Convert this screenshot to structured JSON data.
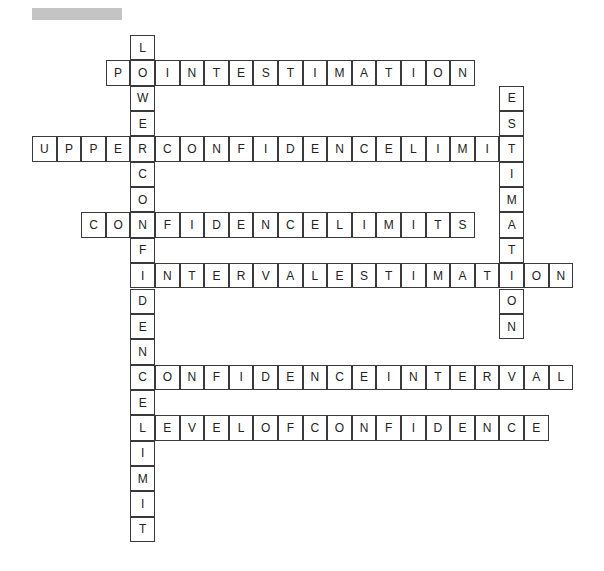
{
  "header": {
    "title_redacted": true
  },
  "grid": {
    "origin_x": 32,
    "origin_y": 35,
    "cell_w": 24.6,
    "cell_h": 25.35
  },
  "words": [
    {
      "answer": "LOWERCONFIDENCELIMIT",
      "dir": "down",
      "col": 4,
      "row": 0
    },
    {
      "answer": "POINTESTIMATION",
      "dir": "across",
      "col": 3,
      "row": 1
    },
    {
      "answer": "ESTIMATION",
      "dir": "down",
      "col": 19,
      "row": 2
    },
    {
      "answer": "UPPERCONFIDENCELIMIT",
      "dir": "across",
      "col": 0,
      "row": 4
    },
    {
      "answer": "CONFIDENCELIMITS",
      "dir": "across",
      "col": 2,
      "row": 7
    },
    {
      "answer": "INTERVALESTIMATION",
      "dir": "across",
      "col": 4,
      "row": 9
    },
    {
      "answer": "CONFIDENCEINTERVAL",
      "dir": "across",
      "col": 4,
      "row": 13
    },
    {
      "answer": "LEVELOFCONFIDENCE",
      "dir": "across",
      "col": 4,
      "row": 15
    }
  ]
}
